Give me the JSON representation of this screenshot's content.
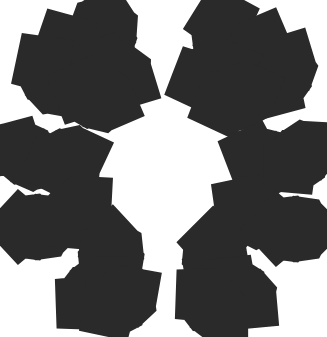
{
  "illustration": {
    "subject": "holly leaves line art",
    "stroke_color": "#2a2a2a",
    "background_color": "#ffffff",
    "clusters": [
      {
        "name": "top-left",
        "leaves": [
          {
            "x": 102,
            "y": 36,
            "angle": -78,
            "len": 44
          },
          {
            "x": 72,
            "y": 55,
            "angle": 62,
            "len": 42
          },
          {
            "x": 52,
            "y": 76,
            "angle": 55,
            "len": 42
          },
          {
            "x": 114,
            "y": 73,
            "angle": 28,
            "len": 42
          },
          {
            "x": 95,
            "y": 96,
            "angle": 22,
            "len": 42
          }
        ]
      },
      {
        "name": "top-right",
        "leaves": [
          {
            "x": 226,
            "y": 36,
            "angle": 75,
            "len": 44
          },
          {
            "x": 256,
            "y": 57,
            "angle": -68,
            "len": 42
          },
          {
            "x": 280,
            "y": 75,
            "angle": -62,
            "len": 42
          },
          {
            "x": 213,
            "y": 75,
            "angle": -22,
            "len": 42
          },
          {
            "x": 236,
            "y": 98,
            "angle": -22,
            "len": 42
          }
        ]
      },
      {
        "name": "mid-left-upper",
        "leaves": [
          {
            "x": 27,
            "y": 155,
            "angle": 32,
            "len": 40
          },
          {
            "x": 66,
            "y": 160,
            "angle": -20,
            "len": 40
          }
        ]
      },
      {
        "name": "mid-left-lower",
        "leaves": [
          {
            "x": 35,
            "y": 227,
            "angle": 0,
            "len": 42
          },
          {
            "x": 75,
            "y": 212,
            "angle": -42,
            "len": 40
          }
        ]
      },
      {
        "name": "mid-right-upper",
        "leaves": [
          {
            "x": 264,
            "y": 160,
            "angle": 22,
            "len": 40
          },
          {
            "x": 300,
            "y": 157,
            "angle": -42,
            "len": 40
          }
        ]
      },
      {
        "name": "mid-right-lower",
        "leaves": [
          {
            "x": 252,
            "y": 213,
            "angle": 35,
            "len": 40
          },
          {
            "x": 293,
            "y": 229,
            "angle": 0,
            "len": 42
          }
        ]
      },
      {
        "name": "bottom-left",
        "leaves": [
          {
            "x": 111,
            "y": 258,
            "angle": -88,
            "len": 42
          },
          {
            "x": 92,
            "y": 293,
            "angle": -45,
            "len": 40
          },
          {
            "x": 120,
            "y": 302,
            "angle": -35,
            "len": 40
          }
        ]
      },
      {
        "name": "bottom-right",
        "leaves": [
          {
            "x": 215,
            "y": 258,
            "angle": 88,
            "len": 42
          },
          {
            "x": 240,
            "y": 293,
            "angle": 40,
            "len": 40
          },
          {
            "x": 212,
            "y": 305,
            "angle": 45,
            "len": 40
          }
        ]
      }
    ]
  }
}
